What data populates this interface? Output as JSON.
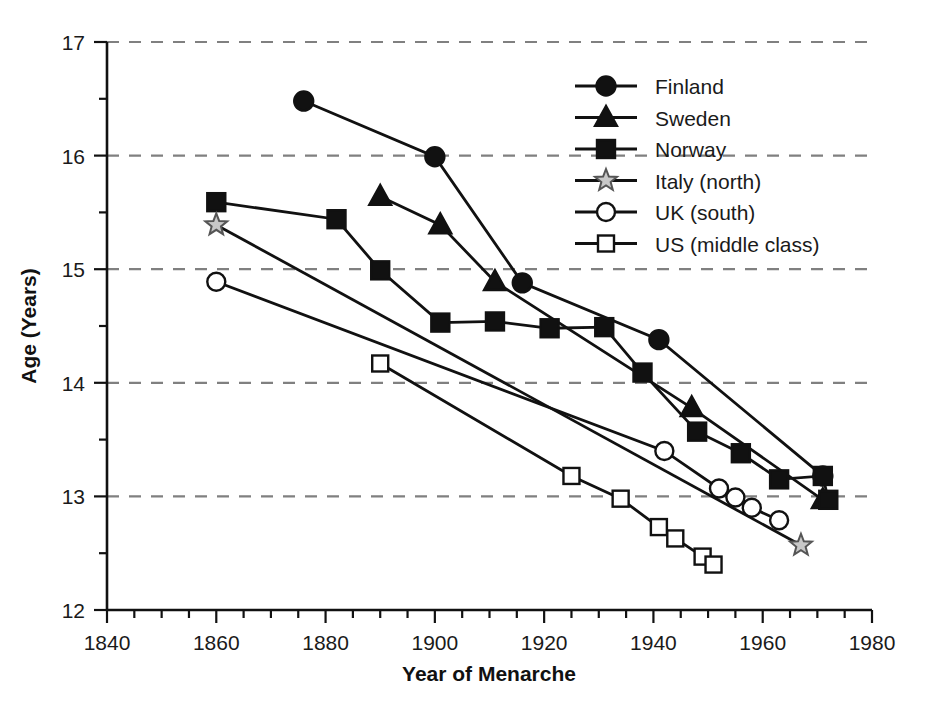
{
  "chart_data": {
    "type": "line",
    "title": "",
    "xlabel": "Year of Menarche",
    "ylabel": "Age (Years)",
    "xlim": [
      1840,
      1980
    ],
    "ylim": [
      12,
      17
    ],
    "xticks": [
      1840,
      1860,
      1880,
      1900,
      1920,
      1940,
      1960,
      1980
    ],
    "xtick_labels": [
      "1840",
      "1860",
      "1880",
      "1900",
      "1920",
      "1940",
      "1960",
      "1980"
    ],
    "xminor_step": 5,
    "yticks": [
      12,
      13,
      14,
      15,
      16,
      17
    ],
    "ytick_labels": [
      "12",
      "13",
      "14",
      "15",
      "16",
      "17"
    ],
    "yminor_step": 0.5,
    "grid": "horizontal-dashed",
    "grid_color": "#808080",
    "legend_position": "upper-right-inside",
    "line_color": "#111111",
    "series": [
      {
        "name": "Finland",
        "marker": "filled-circle",
        "marker_fill": "#111111",
        "points": [
          {
            "x": 1876,
            "y": 16.48
          },
          {
            "x": 1900,
            "y": 15.99
          },
          {
            "x": 1916,
            "y": 14.88
          },
          {
            "x": 1941,
            "y": 14.38
          },
          {
            "x": 1971,
            "y": 13.18
          }
        ]
      },
      {
        "name": "Sweden",
        "marker": "filled-triangle",
        "marker_fill": "#111111",
        "points": [
          {
            "x": 1890,
            "y": 15.64
          },
          {
            "x": 1901,
            "y": 15.39
          },
          {
            "x": 1911,
            "y": 14.89
          },
          {
            "x": 1947,
            "y": 13.78
          },
          {
            "x": 1971,
            "y": 12.97
          }
        ]
      },
      {
        "name": "Norway",
        "marker": "filled-square",
        "marker_fill": "#111111",
        "points": [
          {
            "x": 1860,
            "y": 15.59
          },
          {
            "x": 1882,
            "y": 15.44
          },
          {
            "x": 1890,
            "y": 14.99
          },
          {
            "x": 1901,
            "y": 14.53
          },
          {
            "x": 1911,
            "y": 14.54
          },
          {
            "x": 1921,
            "y": 14.48
          },
          {
            "x": 1931,
            "y": 14.49
          },
          {
            "x": 1938,
            "y": 14.09
          },
          {
            "x": 1948,
            "y": 13.57
          },
          {
            "x": 1956,
            "y": 13.38
          },
          {
            "x": 1963,
            "y": 13.15
          },
          {
            "x": 1971,
            "y": 13.18
          },
          {
            "x": 1972,
            "y": 12.97
          }
        ]
      },
      {
        "name": "Italy (north)",
        "marker": "open-star",
        "marker_fill": "#c8c8c8",
        "points": [
          {
            "x": 1860,
            "y": 15.39
          },
          {
            "x": 1967,
            "y": 12.57
          }
        ]
      },
      {
        "name": "UK (south)",
        "marker": "open-circle",
        "marker_fill": "#ffffff",
        "points": [
          {
            "x": 1860,
            "y": 14.89
          },
          {
            "x": 1942,
            "y": 13.4
          },
          {
            "x": 1952,
            "y": 13.07
          },
          {
            "x": 1955,
            "y": 12.99
          },
          {
            "x": 1958,
            "y": 12.9
          },
          {
            "x": 1963,
            "y": 12.79
          }
        ]
      },
      {
        "name": "US (middle class)",
        "marker": "open-square",
        "marker_fill": "#ffffff",
        "points": [
          {
            "x": 1890,
            "y": 14.17
          },
          {
            "x": 1925,
            "y": 13.18
          },
          {
            "x": 1934,
            "y": 12.98
          },
          {
            "x": 1941,
            "y": 12.73
          },
          {
            "x": 1944,
            "y": 12.63
          },
          {
            "x": 1949,
            "y": 12.47
          },
          {
            "x": 1951,
            "y": 12.4
          }
        ]
      }
    ]
  },
  "legend": {
    "entries": [
      {
        "label": "Finland"
      },
      {
        "label": "Sweden"
      },
      {
        "label": "Norway"
      },
      {
        "label": "Italy (north)"
      },
      {
        "label": "UK (south)"
      },
      {
        "label": "US (middle class)"
      }
    ]
  }
}
